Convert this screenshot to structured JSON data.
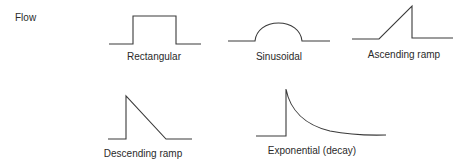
{
  "diagram": {
    "axis_label": "Flow",
    "waveforms": [
      {
        "name": "rectangular",
        "label": "Rectangular"
      },
      {
        "name": "sinusoidal",
        "label": "Sinusoidal"
      },
      {
        "name": "ascending-ramp",
        "label": "Ascending ramp"
      },
      {
        "name": "descending-ramp",
        "label": "Descending ramp"
      },
      {
        "name": "exponential-decay",
        "label": "Exponential (decay)"
      }
    ],
    "line_color": "#3a3a3a"
  }
}
